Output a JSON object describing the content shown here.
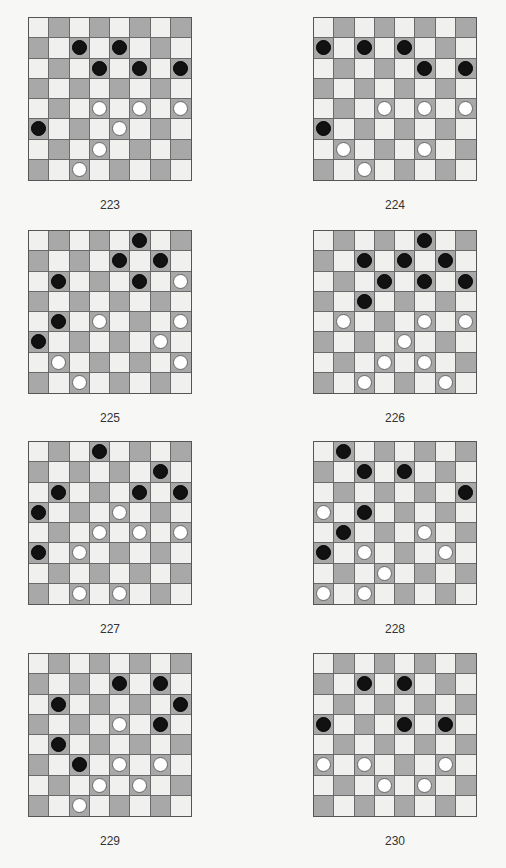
{
  "colors": {
    "dark_square": "#a8a8a8",
    "light_square": "#f0f0ef",
    "black_piece": "#111111",
    "white_piece": "#ffffff"
  },
  "puzzles": [
    {
      "number": "223",
      "black": [
        [
          1,
          2
        ],
        [
          1,
          4
        ],
        [
          2,
          3
        ],
        [
          2,
          5
        ],
        [
          2,
          7
        ],
        [
          5,
          0
        ]
      ],
      "white": [
        [
          4,
          3
        ],
        [
          4,
          5
        ],
        [
          4,
          7
        ],
        [
          5,
          4
        ],
        [
          6,
          3
        ],
        [
          7,
          2
        ]
      ]
    },
    {
      "number": "224",
      "black": [
        [
          1,
          0
        ],
        [
          1,
          2
        ],
        [
          1,
          4
        ],
        [
          2,
          5
        ],
        [
          2,
          7
        ],
        [
          5,
          0
        ]
      ],
      "white": [
        [
          4,
          3
        ],
        [
          4,
          5
        ],
        [
          4,
          7
        ],
        [
          6,
          1
        ],
        [
          6,
          5
        ],
        [
          7,
          2
        ]
      ]
    },
    {
      "number": "225",
      "black": [
        [
          0,
          5
        ],
        [
          1,
          4
        ],
        [
          1,
          6
        ],
        [
          2,
          1
        ],
        [
          2,
          5
        ],
        [
          4,
          1
        ],
        [
          5,
          0
        ]
      ],
      "white": [
        [
          2,
          7
        ],
        [
          4,
          3
        ],
        [
          4,
          7
        ],
        [
          5,
          6
        ],
        [
          6,
          1
        ],
        [
          6,
          7
        ],
        [
          7,
          2
        ]
      ]
    },
    {
      "number": "226",
      "black": [
        [
          0,
          5
        ],
        [
          1,
          2
        ],
        [
          1,
          4
        ],
        [
          1,
          6
        ],
        [
          2,
          3
        ],
        [
          2,
          5
        ],
        [
          2,
          7
        ],
        [
          3,
          2
        ]
      ],
      "white": [
        [
          4,
          1
        ],
        [
          4,
          5
        ],
        [
          4,
          7
        ],
        [
          5,
          4
        ],
        [
          6,
          3
        ],
        [
          6,
          5
        ],
        [
          7,
          2
        ],
        [
          7,
          6
        ]
      ]
    },
    {
      "number": "227",
      "black": [
        [
          0,
          3
        ],
        [
          1,
          6
        ],
        [
          2,
          1
        ],
        [
          2,
          5
        ],
        [
          2,
          7
        ],
        [
          3,
          0
        ],
        [
          5,
          0
        ]
      ],
      "white": [
        [
          3,
          4
        ],
        [
          4,
          3
        ],
        [
          4,
          5
        ],
        [
          4,
          7
        ],
        [
          5,
          2
        ],
        [
          7,
          2
        ],
        [
          7,
          4
        ]
      ]
    },
    {
      "number": "228",
      "black": [
        [
          0,
          1
        ],
        [
          1,
          2
        ],
        [
          1,
          4
        ],
        [
          2,
          7
        ],
        [
          3,
          2
        ],
        [
          4,
          1
        ],
        [
          5,
          0
        ]
      ],
      "white": [
        [
          3,
          0
        ],
        [
          4,
          5
        ],
        [
          5,
          2
        ],
        [
          5,
          6
        ],
        [
          6,
          3
        ],
        [
          7,
          0
        ],
        [
          7,
          2
        ]
      ]
    },
    {
      "number": "229",
      "black": [
        [
          1,
          4
        ],
        [
          1,
          6
        ],
        [
          2,
          1
        ],
        [
          2,
          7
        ],
        [
          3,
          6
        ],
        [
          4,
          1
        ],
        [
          5,
          2
        ]
      ],
      "white": [
        [
          3,
          4
        ],
        [
          5,
          4
        ],
        [
          5,
          6
        ],
        [
          6,
          3
        ],
        [
          6,
          5
        ],
        [
          7,
          2
        ]
      ]
    },
    {
      "number": "230",
      "black": [
        [
          1,
          2
        ],
        [
          1,
          4
        ],
        [
          3,
          0
        ],
        [
          3,
          4
        ],
        [
          3,
          6
        ]
      ],
      "white": [
        [
          5,
          0
        ],
        [
          5,
          2
        ],
        [
          5,
          6
        ],
        [
          6,
          3
        ],
        [
          6,
          5
        ]
      ]
    }
  ]
}
